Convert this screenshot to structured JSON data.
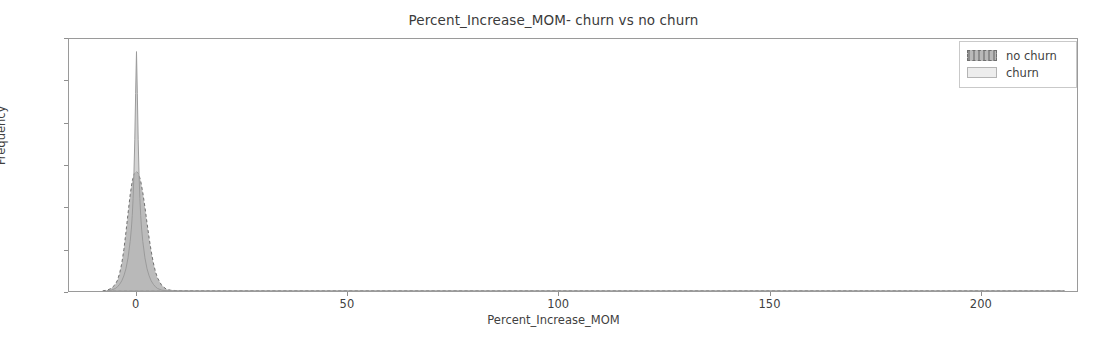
{
  "chart_data": {
    "type": "area",
    "title": "Percent_Increase_MOM- churn vs no churn",
    "xlabel": "Percent_Increase_MOM",
    "ylabel": "Frequency",
    "xlim": [
      -16,
      223
    ],
    "ylim": [
      0.0,
      0.6
    ],
    "grid": false,
    "legend_position": "upper right",
    "xticks": [
      0,
      50,
      100,
      150,
      200
    ],
    "xticklabels": [
      "0",
      "50",
      "100",
      "150",
      "200"
    ],
    "yticks": [
      0.0,
      0.1,
      0.2,
      0.3,
      0.4,
      0.5,
      0.6
    ],
    "yticklabels": [
      "0.0",
      "0.1",
      "0.2",
      "0.3",
      "0.4",
      "0.5",
      "0.6"
    ],
    "series": [
      {
        "name": "no churn",
        "peak_x": 0.0,
        "peak_y": 0.285,
        "fill_color": "#b0b0b0",
        "line_color": "#6f6f6f",
        "line_style": "dashed",
        "x": [
          -8.0,
          -7.0,
          -6.0,
          -5.0,
          -4.5,
          -4.0,
          -3.5,
          -3.0,
          -2.5,
          -2.0,
          -1.5,
          -1.0,
          -0.5,
          0.0,
          0.5,
          1.0,
          1.5,
          2.0,
          2.5,
          3.0,
          3.5,
          4.0,
          4.5,
          5.0,
          6.0,
          7.0,
          8.0,
          10.0,
          14.0,
          25.0,
          60.0,
          120.0,
          200.0,
          220.0
        ],
        "y": [
          0.0,
          0.002,
          0.006,
          0.016,
          0.026,
          0.042,
          0.065,
          0.098,
          0.14,
          0.185,
          0.229,
          0.262,
          0.28,
          0.285,
          0.279,
          0.262,
          0.234,
          0.2,
          0.162,
          0.126,
          0.094,
          0.067,
          0.046,
          0.031,
          0.013,
          0.005,
          0.002,
          0.0005,
          0.0001,
          0.0,
          0.0,
          0.0,
          0.0,
          0.0
        ]
      },
      {
        "name": "churn",
        "peak_x": 0.0,
        "peak_y": 0.57,
        "fill_color": "#b8b8b8",
        "line_color": "#9a9a9a",
        "line_style": "solid",
        "x": [
          -7.0,
          -6.0,
          -5.0,
          -4.5,
          -4.0,
          -3.5,
          -3.0,
          -2.5,
          -2.0,
          -1.5,
          -1.2,
          -1.0,
          -0.8,
          -0.6,
          -0.4,
          -0.2,
          0.0,
          0.2,
          0.4,
          0.6,
          0.8,
          1.0,
          1.2,
          1.5,
          2.0,
          2.5,
          3.0,
          3.5,
          4.0,
          4.5,
          5.0,
          6.0,
          7.0,
          9.0,
          12.0,
          25.0,
          60.0,
          120.0,
          200.0,
          220.0
        ],
        "y": [
          0.0,
          0.002,
          0.006,
          0.01,
          0.016,
          0.024,
          0.036,
          0.053,
          0.079,
          0.118,
          0.15,
          0.18,
          0.22,
          0.28,
          0.36,
          0.47,
          0.57,
          0.47,
          0.36,
          0.28,
          0.22,
          0.18,
          0.15,
          0.118,
          0.079,
          0.053,
          0.036,
          0.024,
          0.016,
          0.01,
          0.006,
          0.002,
          0.0008,
          0.0002,
          0.0,
          0.0,
          0.0,
          0.0,
          0.0,
          0.0
        ]
      }
    ]
  },
  "legend": {
    "items": [
      {
        "label": "no churn"
      },
      {
        "label": "churn"
      }
    ]
  }
}
